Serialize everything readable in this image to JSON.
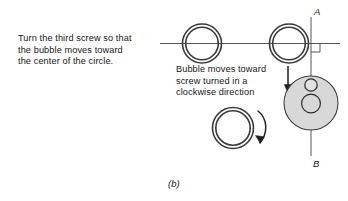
{
  "figure": {
    "caption": "(b)",
    "instruction": {
      "lines": [
        "Turn the third screw so that",
        "the bubble moves toward",
        "the center of the circle."
      ]
    },
    "note": {
      "lines": [
        "Bubble moves toward",
        "screw turned in a",
        "clockwise direction"
      ]
    },
    "axis": {
      "top_label": "A",
      "bottom_label": "B"
    },
    "colors": {
      "ink": "#161616",
      "line": "#3a3a3a",
      "shade_fill": "#d6d6d6",
      "background": "#ffffff"
    },
    "elements": {
      "screw_left_name": "screw-ring-left",
      "screw_right_name": "screw-ring-right",
      "screw_bottom_name": "screw-ring-bottom",
      "vial_name": "shaded-level-vial",
      "bubble_name": "bubble-circle",
      "center_name": "center-circle",
      "down_arrow_name": "down-arrow",
      "curved_arrow_name": "clockwise-curved-arrow",
      "right_angle_name": "right-angle-marker",
      "baseline_name": "horizontal-baseline"
    }
  }
}
